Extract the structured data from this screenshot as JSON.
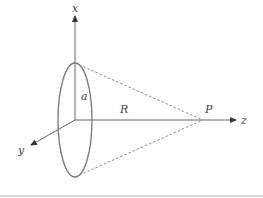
{
  "diagram": {
    "labels": {
      "x_axis": "x",
      "y_axis": "y",
      "z_axis": "z",
      "radius": "a",
      "distance": "R",
      "point": "P"
    },
    "colors": {
      "line": "#666666",
      "dashed": "#888888",
      "text": "#444444"
    }
  }
}
